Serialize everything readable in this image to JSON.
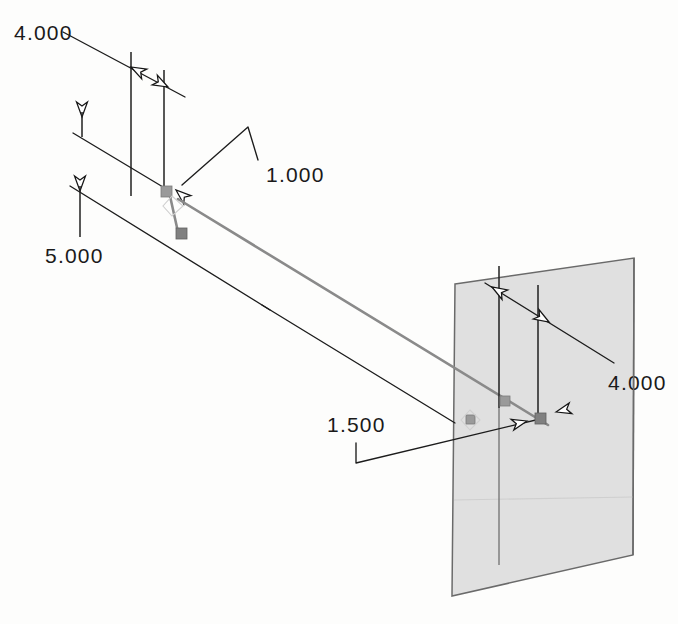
{
  "drawing": {
    "title": "Isometric dimensioned sketch",
    "background_color": "#fdfdfc",
    "line_color": "#1c1c1c",
    "construction_color": "#8a8a8a",
    "plane_fill_color": "#e0e0e0",
    "plane_edge_color": "#6a6a6a"
  },
  "dimensions": [
    {
      "id": "dim-4000-top-left",
      "value": "4.000",
      "label_x": 14,
      "label_y": 40,
      "placement": "top-left",
      "kind": "linear",
      "arrows": 2
    },
    {
      "id": "dim-1000",
      "value": "1.000",
      "label_x": 266,
      "label_y": 182,
      "placement": "upper-middle",
      "kind": "leader",
      "arrows": 1
    },
    {
      "id": "dim-5000",
      "value": "5.000",
      "label_x": 45,
      "label_y": 263,
      "placement": "mid-left",
      "kind": "leader",
      "arrows": 1
    },
    {
      "id": "dim-1500",
      "value": "1.500",
      "label_x": 327,
      "label_y": 432,
      "placement": "lower-middle",
      "kind": "leader",
      "arrows": 1
    },
    {
      "id": "dim-4000-right",
      "value": "4.000",
      "label_x": 608,
      "label_y": 390,
      "placement": "right-of-plane",
      "kind": "linear",
      "arrows": 2
    }
  ],
  "geometry": {
    "plane": {
      "name": "reference-plane",
      "points": "455,284 634,258 633,555 452,596",
      "fill": "#e0e0e0"
    },
    "construction_line": {
      "name": "long-sloped-construction-line",
      "from_x": 178,
      "from_y": 198,
      "to_x": 547,
      "to_y": 424
    },
    "nodes": [
      {
        "name": "node-upper-point",
        "x": 166,
        "y": 190
      },
      {
        "name": "node-lower-point",
        "x": 181,
        "y": 233
      },
      {
        "name": "node-plane-point-a",
        "x": 505,
        "y": 404
      },
      {
        "name": "node-plane-point-b",
        "x": 541,
        "y": 419
      }
    ]
  }
}
